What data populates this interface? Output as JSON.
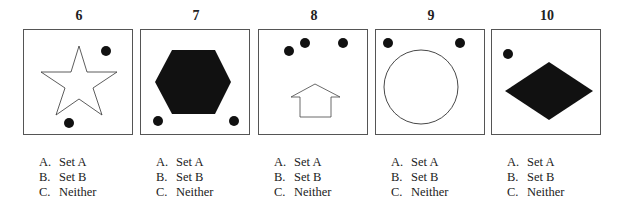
{
  "questions": [
    {
      "number": "6",
      "figure": "outline-star with two dots",
      "options": [
        {
          "letter": "A.",
          "text": "Set A"
        },
        {
          "letter": "B.",
          "text": "Set B"
        },
        {
          "letter": "C.",
          "text": "Neither"
        }
      ]
    },
    {
      "number": "7",
      "figure": "filled-hexagon with two dots",
      "options": [
        {
          "letter": "A.",
          "text": "Set A"
        },
        {
          "letter": "B.",
          "text": "Set B"
        },
        {
          "letter": "C.",
          "text": "Neither"
        }
      ]
    },
    {
      "number": "8",
      "figure": "outline-up-arrow with three dots",
      "options": [
        {
          "letter": "A.",
          "text": "Set A"
        },
        {
          "letter": "B.",
          "text": "Set B"
        },
        {
          "letter": "C.",
          "text": "Neither"
        }
      ]
    },
    {
      "number": "9",
      "figure": "outline-circle with two dots",
      "options": [
        {
          "letter": "A.",
          "text": "Set A"
        },
        {
          "letter": "B.",
          "text": "Set B"
        },
        {
          "letter": "C.",
          "text": "Neither"
        }
      ]
    },
    {
      "number": "10",
      "figure": "filled-diamond with one dot",
      "options": [
        {
          "letter": "A.",
          "text": "Set A"
        },
        {
          "letter": "B.",
          "text": "Set B"
        },
        {
          "letter": "C.",
          "text": "Neither"
        }
      ]
    }
  ]
}
